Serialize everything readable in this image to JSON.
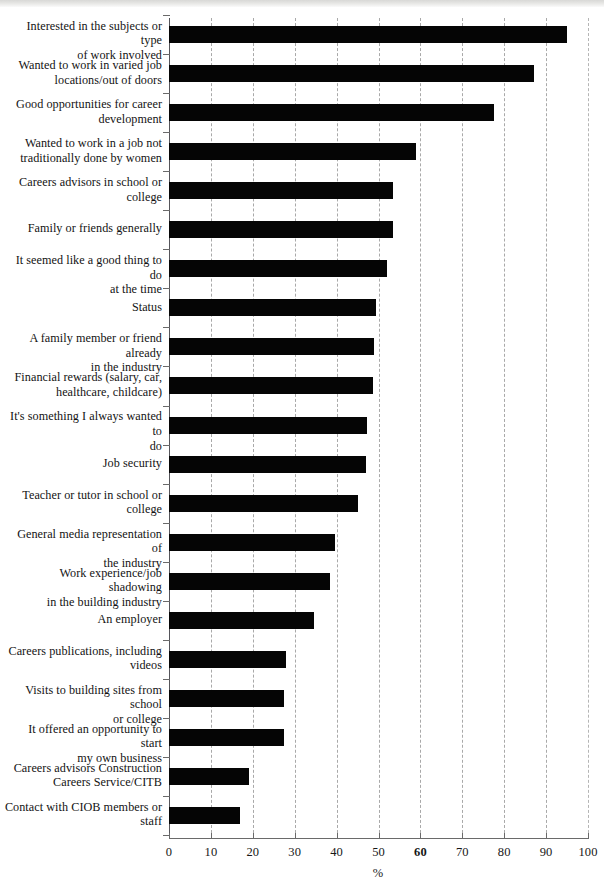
{
  "chart_data": {
    "type": "bar",
    "orientation": "horizontal",
    "title": "",
    "xlabel": "%",
    "ylabel": "",
    "xlim": [
      0,
      100
    ],
    "xticks": [
      0,
      10,
      20,
      30,
      40,
      50,
      60,
      70,
      80,
      90,
      100
    ],
    "xtick_labels": [
      "0",
      "10",
      "20",
      "30",
      "40",
      "50",
      "60",
      "70",
      "80",
      "90",
      "100"
    ],
    "grid": "vertical-dashed",
    "legend": "none",
    "bar_color": "#050505",
    "categories": [
      "Interested in the subjects or type of work involved",
      "Wanted to work in varied job locations/out of doors",
      "Good opportunities for career development",
      "Wanted to work in a job not traditionally done by women",
      "Careers advisors in school or college",
      "Family or friends generally",
      "It seemed like a good thing to do at the time",
      "Status",
      "A family member or friend already in the industry",
      "Financial rewards (salary, car, healthcare, childcare)",
      "It's something I always wanted to do",
      "Job security",
      "Teacher or tutor in school or college",
      "General media representation of the industry",
      "Work experience/job shadowing in the building industry",
      "An employer",
      "Careers publications, including videos",
      "Visits to building sites from school or college",
      "It offered an opportunity to start my own business",
      "Careers advisors Construction Careers Service/CITB",
      "Contact with CIOB members or staff"
    ],
    "category_lines": [
      [
        "Interested in the subjects or type",
        "of work involved"
      ],
      [
        "Wanted to work in varied job",
        "locations/out of doors"
      ],
      [
        "Good opportunities for career",
        "development"
      ],
      [
        "Wanted to work in a job not",
        "traditionally done by women"
      ],
      [
        "Careers advisors in school or",
        "college"
      ],
      [
        "Family or friends generally"
      ],
      [
        "It seemed like a good thing to do",
        "at the time"
      ],
      [
        "Status"
      ],
      [
        "A family member or friend already",
        "in the industry"
      ],
      [
        "Financial rewards (salary, car,",
        "healthcare, childcare)"
      ],
      [
        "It's something I always wanted to",
        "do"
      ],
      [
        "Job security"
      ],
      [
        "Teacher or tutor in school or",
        "college"
      ],
      [
        "General media representation of",
        "the industry"
      ],
      [
        "Work experience/job shadowing",
        "in the building industry"
      ],
      [
        "An employer"
      ],
      [
        "Careers publications, including",
        "videos"
      ],
      [
        "Visits to building sites from school",
        "or college"
      ],
      [
        "It offered an opportunity to start",
        "my own business"
      ],
      [
        "Careers advisors Construction",
        "Careers Service/CITB"
      ],
      [
        "Contact with CIOB members or",
        "staff"
      ]
    ],
    "values": [
      95,
      87,
      77.5,
      59,
      53.5,
      53.5,
      52,
      49.5,
      49,
      48.7,
      47.3,
      47,
      45,
      39.5,
      38.5,
      34.5,
      28,
      27.5,
      27.5,
      19,
      17
    ]
  }
}
